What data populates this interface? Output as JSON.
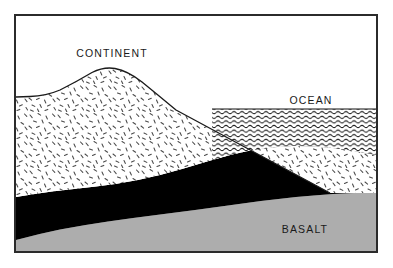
{
  "figure": {
    "type": "geologic-cross-section",
    "title_visible": false,
    "background_color": "#ffffff",
    "frame": {
      "stroke_color": "#2b2b2b",
      "stroke_width": 2,
      "x": 14,
      "y": 14,
      "width": 364,
      "height": 239
    }
  },
  "labels": {
    "continent": "CONTINENT",
    "ocean": "OCEAN",
    "basalt": "BASALT"
  },
  "label_positions": {
    "continent": {
      "x": 112,
      "y": 57,
      "anchor": "middle"
    },
    "ocean": {
      "x": 311,
      "y": 104,
      "anchor": "middle"
    },
    "basalt": {
      "x": 305,
      "y": 233,
      "anchor": "middle"
    }
  },
  "layers": [
    {
      "name": "continental-crust",
      "label": "CONTINENT",
      "fill_style": "random-dash-stipple",
      "fill_color": "#ffffff",
      "pattern_color": "#4a4a4a",
      "outline_color": "#1a1a1a"
    },
    {
      "name": "ocean-water",
      "label": "OCEAN",
      "fill_style": "horizontal-wave-hatch",
      "fill_color": "#ffffff",
      "pattern_color": "#111111",
      "outline_color": "#111111"
    },
    {
      "name": "lower-crust",
      "label": "",
      "fill_style": "solid",
      "fill_color": "#000000",
      "outline_color": "#000000"
    },
    {
      "name": "basalt",
      "label": "BASALT",
      "fill_style": "solid",
      "fill_color": "#adadad",
      "outline_color": "#adadad"
    }
  ],
  "geometry": {
    "continent_surface_path": "M 16 97 L 30 96.5 Q 46 96 60 90 Q 76 82 92 72.5 Q 104 66.5 115 68.5 Q 128 71 142 82 Q 158 95 176 110 L 330 193 L 376 193",
    "ocean_surface_y": 109,
    "ocean_left_boundary_x": 212,
    "ocean_right_boundary_x": 376,
    "ocean_bottom_right_y": 163,
    "lower_crust_top_path": "M 16 197 Q 34 194 52 191.5 Q 74 189 96 186.5 Q 118 184 138 180 Q 160 175.5 182 169 Q 208 161 232 154.5 Q 262 147 292 146 Q 320 145.5 348 150 Q 364 152.5 376 155",
    "lower_crust_bottom_path": "M 16 240 Q 38 234 60 229.5 Q 84 225 108 221.5 Q 136 217.5 164 214 Q 196 210 228 205.5 Q 262 200.5 296 197 Q 330 193.5 376 192",
    "basalt_top_path": "M 16 240 Q 38 234 60 229.5 Q 84 225 108 221.5 Q 136 217.5 164 214 Q 196 210 228 205.5 Q 262 200.5 296 197 Q 330 193.5 376 192",
    "frame_bottom_y": 252
  },
  "annotations": {
    "description": "Schematic geologic cross-section showing a continent of low-density crust floating on a dense lower crust above basalt, with an adjacent ocean basin.",
    "peak_apex": {
      "x": 115,
      "y": 68
    },
    "shoreline": {
      "x": 212,
      "y": 109
    }
  }
}
